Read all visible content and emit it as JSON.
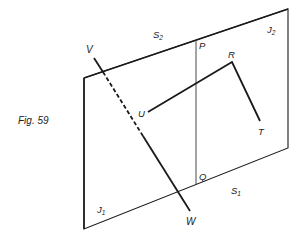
{
  "figure": {
    "caption": "Fig. 59",
    "labels": {
      "V": "V",
      "W": "W",
      "P": "P",
      "Q": "Q",
      "R": "R",
      "T": "T",
      "U": "U",
      "S2": "S",
      "S2_sub": "2",
      "S1": "S",
      "S1_sub": "1",
      "J1": "J",
      "J1_sub": "1",
      "J2": "J",
      "J2_sub": "2"
    },
    "colors": {
      "stroke": "#1a1a1a",
      "background": "#ffffff"
    }
  }
}
